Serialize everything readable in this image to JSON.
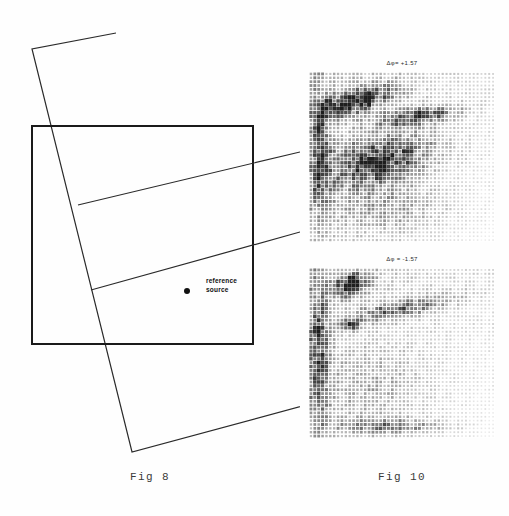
{
  "page": {
    "background_color": "#ffffff",
    "ink_color": "#1a1a1a"
  },
  "figures": [
    {
      "id": "fig8",
      "caption": "Fig 8",
      "type": "line-diagram",
      "annotations": [
        {
          "name": "reference-source",
          "line1": "reference",
          "line2": "source"
        }
      ],
      "geometry": {
        "rectangle": {
          "x": 32,
          "y": 126,
          "width": 221,
          "height": 218
        },
        "tilted_quad_points": "116,33 32,49 132,452 310,404",
        "diagonal_line_1": "78,205 300,152",
        "diagonal_line_2": "91,290 300,232"
      }
    },
    {
      "id": "fig10",
      "caption": "Fig 10",
      "type": "halftone-interferograms",
      "panels": [
        {
          "name": "panel-phase-plus",
          "caption": "Δφ= +1.57",
          "x": 14,
          "y": 72,
          "width": 186,
          "height": 170
        },
        {
          "name": "panel-phase-minus",
          "caption": "Δφ = -1.57",
          "x": 14,
          "y": 268,
          "width": 186,
          "height": 170,
          "marker": "arrow pointing up-right at bright fringe"
        }
      ]
    }
  ],
  "chart_data": {
    "type": "heatmap",
    "title": "Fig 10",
    "xlabel": "",
    "ylabel": "",
    "panels": [
      {
        "name": "Δφ= +1.57",
        "description": "Dot-matrix halftone speckle interferogram; dark elongated fringe lobes in upper-left quadrant, broad diffuse dark band across the middle, lighter toward the lower-right corner.",
        "grid": [
          48,
          44
        ],
        "intensity_range": [
          0,
          1
        ],
        "features": [
          {
            "name": "upper-left-lobe",
            "cx": 0.26,
            "cy": 0.17,
            "rx": 0.22,
            "ry": 0.07,
            "angle": -18,
            "intensity": 0.95
          },
          {
            "name": "upper-right-lobe",
            "cx": 0.58,
            "cy": 0.26,
            "rx": 0.22,
            "ry": 0.05,
            "angle": -8,
            "intensity": 0.72
          },
          {
            "name": "central-band",
            "cx": 0.38,
            "cy": 0.52,
            "rx": 0.3,
            "ry": 0.14,
            "angle": -14,
            "intensity": 0.8
          },
          {
            "name": "left-edge-band",
            "cx": 0.06,
            "cy": 0.48,
            "rx": 0.06,
            "ry": 0.4,
            "angle": 0,
            "intensity": 0.55
          },
          {
            "name": "lower-diffuse",
            "cx": 0.42,
            "cy": 0.8,
            "rx": 0.34,
            "ry": 0.16,
            "angle": 0,
            "intensity": 0.26
          }
        ]
      },
      {
        "name": "Δφ = -1.57",
        "description": "Dot-matrix halftone speckle interferogram; a compact intense dark lobe near the upper-left, a second smaller bright spot indicated by an arrow, diagonal streak toward the upper-right, lightening toward the lower-right corner.",
        "grid": [
          48,
          44
        ],
        "intensity_range": [
          0,
          1
        ],
        "features": [
          {
            "name": "upper-left-core",
            "cx": 0.22,
            "cy": 0.1,
            "rx": 0.1,
            "ry": 0.06,
            "angle": -20,
            "intensity": 1.0
          },
          {
            "name": "arrow-target-spot",
            "cx": 0.22,
            "cy": 0.33,
            "rx": 0.04,
            "ry": 0.03,
            "angle": 0,
            "intensity": 0.95
          },
          {
            "name": "diagonal-streak",
            "cx": 0.5,
            "cy": 0.24,
            "rx": 0.28,
            "ry": 0.05,
            "angle": -12,
            "intensity": 0.55
          },
          {
            "name": "left-edge-band",
            "cx": 0.05,
            "cy": 0.5,
            "rx": 0.06,
            "ry": 0.45,
            "angle": 0,
            "intensity": 0.6
          },
          {
            "name": "bottom-band",
            "cx": 0.42,
            "cy": 0.93,
            "rx": 0.32,
            "ry": 0.05,
            "angle": 0,
            "intensity": 0.45
          },
          {
            "name": "lower-diffuse",
            "cx": 0.35,
            "cy": 0.7,
            "rx": 0.32,
            "ry": 0.22,
            "angle": 0,
            "intensity": 0.18
          }
        ]
      }
    ]
  }
}
